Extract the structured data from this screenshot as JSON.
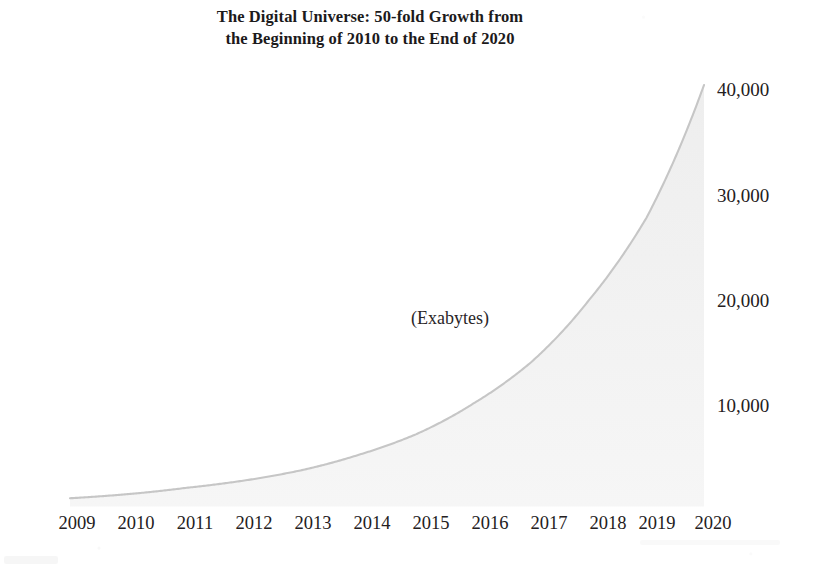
{
  "chart_data": {
    "type": "area",
    "title": "The Digital Universe: 50-fold Growth from the Beginning of 2010 to the End of 2020",
    "title_lines": [
      "The Digital Universe: 50-fold Growth from",
      "the Beginning of 2010 to the End of 2020"
    ],
    "subtitle": "",
    "annotation": "(Exabytes)",
    "xlabel": "",
    "ylabel": "",
    "unit": "Exabytes",
    "x": [
      2009,
      2010,
      2011,
      2012,
      2013,
      2014,
      2015,
      2016,
      2017,
      2018,
      2019,
      2020
    ],
    "categories": [
      "2009",
      "2010",
      "2011",
      "2012",
      "2013",
      "2014",
      "2015",
      "2016",
      "2017",
      "2018",
      "2019",
      "2020"
    ],
    "values": [
      800,
      1200,
      1800,
      2500,
      3500,
      5000,
      7000,
      10000,
      14000,
      20000,
      28000,
      40900
    ],
    "series": [
      {
        "name": "Digital Universe size",
        "unit": "Exabytes",
        "values": [
          800,
          1200,
          1800,
          2500,
          3500,
          5000,
          7000,
          10000,
          14000,
          20000,
          28000,
          40900
        ]
      }
    ],
    "yticks": [
      10000,
      20000,
      30000,
      40000
    ],
    "ytick_labels": [
      "10,000",
      "20,000",
      "30,000",
      "40,000"
    ],
    "xtick_labels": [
      "2009",
      "2010",
      "2011",
      "2012",
      "2013",
      "2014",
      "2015",
      "2016",
      "2017",
      "2018",
      "2019",
      "2020"
    ],
    "xlim": [
      2009,
      2020
    ],
    "ylim": [
      0,
      41000
    ],
    "grid": false,
    "legend": "none",
    "y_axis_position": "right",
    "colors": {
      "fill": "#f2f2f2",
      "edge": "#c9c9c9",
      "axis": "#9a9a9a",
      "text": "#242021",
      "background": "#ffffff"
    }
  },
  "axis": {
    "y_ticks": [
      {
        "label": "40,000",
        "value": 40000,
        "top": 80
      },
      {
        "label": "30,000",
        "value": 30000,
        "top": 186
      },
      {
        "label": "20,000",
        "value": 20000,
        "top": 291
      },
      {
        "label": "10,000",
        "value": 10000,
        "top": 396
      }
    ],
    "x_ticks": [
      {
        "label": "2009",
        "left": 45
      },
      {
        "label": "2010",
        "left": 104
      },
      {
        "label": "2011",
        "left": 163
      },
      {
        "label": "2012",
        "left": 222
      },
      {
        "label": "2013",
        "left": 281
      },
      {
        "label": "2014",
        "left": 340
      },
      {
        "label": "2015",
        "left": 399
      },
      {
        "label": "2016",
        "left": 458
      },
      {
        "label": "2017",
        "left": 517
      },
      {
        "label": "2018",
        "left": 576
      },
      {
        "label": "2019",
        "left": 625
      },
      {
        "label": "2020",
        "left": 681
      }
    ]
  }
}
